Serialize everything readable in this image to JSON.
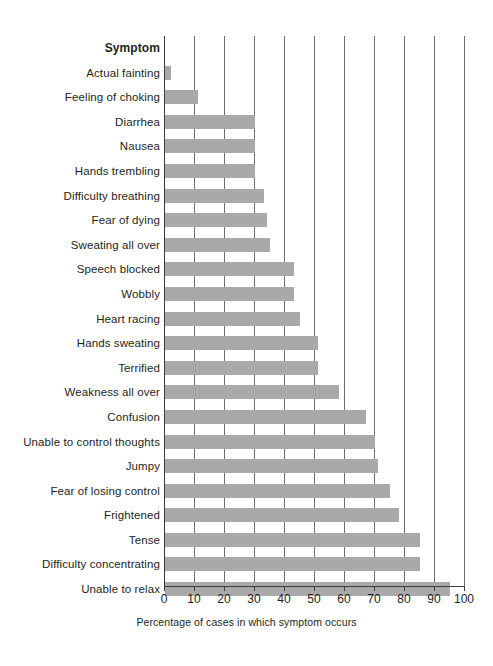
{
  "chart_data": {
    "type": "bar",
    "orientation": "horizontal",
    "title": "",
    "xlabel": "Percentage of cases in which symptom occurs",
    "ylabel": "Symptom",
    "xlim": [
      0,
      100
    ],
    "xticks": [
      0,
      10,
      20,
      30,
      40,
      50,
      60,
      70,
      80,
      90,
      100
    ],
    "grid": true,
    "legend": null,
    "bar_color": "#a9a9a9",
    "categories": [
      "Actual fainting",
      "Feeling of choking",
      "Diarrhea",
      "Nausea",
      "Hands trembling",
      "Difficulty breathing",
      "Fear of dying",
      "Sweating all over",
      "Speech blocked",
      "Wobbly",
      "Heart racing",
      "Hands sweating",
      "Terrified",
      "Weakness all over",
      "Confusion",
      "Unable to control thoughts",
      "Jumpy",
      "Fear of losing control",
      "Frightened",
      "Tense",
      "Difficulty concentrating",
      "Unable to relax"
    ],
    "values": [
      2,
      11,
      30,
      30,
      30,
      33,
      34,
      35,
      43,
      43,
      45,
      51,
      51,
      58,
      67,
      70,
      71,
      75,
      78,
      85,
      85,
      95
    ]
  },
  "axis": {
    "column_header": "Symptom",
    "caption": "Percentage of cases in which symptom occurs",
    "tick_labels": [
      "0",
      "10",
      "20",
      "30",
      "40",
      "50",
      "60",
      "70",
      "80",
      "90",
      "100"
    ]
  }
}
